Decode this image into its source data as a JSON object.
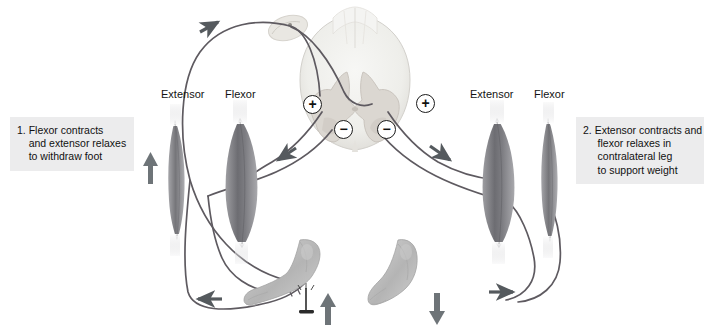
{
  "figure": {
    "background_color": "#ffffff"
  },
  "captions": {
    "left": {
      "number": "1.",
      "text": "1. Flexor contracts\n    and extensor relaxes\n    to withdraw foot",
      "background_color": "#ececed"
    },
    "right": {
      "number": "2.",
      "text": "2. Extensor contracts and\n     flexor relaxes in\n     contralateral leg\n     to support weight",
      "background_color": "#ececed"
    }
  },
  "muscle_labels": {
    "left_extensor": "Extensor",
    "left_flexor": "Flexor",
    "right_extensor": "Extensor",
    "right_flexor": "Flexor"
  },
  "synapse_signs": {
    "plus_left": "+",
    "minus_left": "−",
    "minus_right": "−",
    "plus_right": "+"
  },
  "anatomy": {
    "spinal_cord": "spinal-cord-cross-section",
    "dorsal_root_ganglion": "dorsal-root-ganglion",
    "gray_matter": "gray-matter-butterfly",
    "left_leg": {
      "extensor_state": "relaxed",
      "flexor_state": "contracted",
      "foot": "left-foot-withdrawing",
      "stimulus": "tack-nail"
    },
    "right_leg": {
      "extensor_state": "contracted",
      "flexor_state": "relaxed",
      "foot": "right-foot-weight-bearing"
    }
  },
  "arrows": {
    "sensory_afferent": "up-right",
    "left_extensor_relax": "up",
    "left_motor_descending": "down-left",
    "right_motor_descending": "down-right",
    "left_foot_lift": "up",
    "right_foot_press": "down",
    "bottom_left_flow": "left",
    "bottom_right_flow": "right"
  },
  "colors": {
    "arrow": "#555a5e",
    "nerve": "#5e5a60",
    "caption_bg": "#ececed",
    "text": "#131313",
    "muscle_dark": "#6f6f73",
    "muscle_light": "#a8a8ac",
    "cord_fill": "#eeeeec",
    "gray_matter": "#d8d4cf",
    "skin": "#bdbdbd"
  }
}
